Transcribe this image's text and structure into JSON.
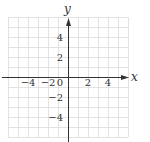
{
  "chart_data": {
    "type": "scatter",
    "title": "",
    "xlabel": "x",
    "ylabel": "y",
    "xlim": [
      -6,
      6
    ],
    "ylim": [
      -6,
      6
    ],
    "grid": true,
    "grid_step": 1,
    "x_ticks": [
      {
        "value": -4,
        "label": "−4"
      },
      {
        "value": -2,
        "label": "−2"
      },
      {
        "value": 0,
        "label": "0"
      },
      {
        "value": 2,
        "label": "2"
      },
      {
        "value": 4,
        "label": "4"
      }
    ],
    "y_ticks": [
      {
        "value": 4,
        "label": "4"
      },
      {
        "value": 2,
        "label": "2"
      },
      {
        "value": -2,
        "label": "−2"
      },
      {
        "value": -4,
        "label": "−4"
      }
    ],
    "series": [],
    "colors": {
      "grid": "#dcdcdc",
      "axis": "#333333",
      "text": "#333333"
    }
  }
}
